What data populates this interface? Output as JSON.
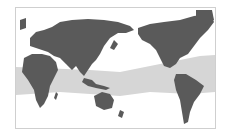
{
  "map": {
    "projection": "pacific-centered world map",
    "colors": {
      "background": "#ffffff",
      "land": "#5a5a5a",
      "highlight_band": "#d6d6d6",
      "border": "#cfcfcf"
    },
    "highlight_region": "tropical band",
    "labels": []
  }
}
